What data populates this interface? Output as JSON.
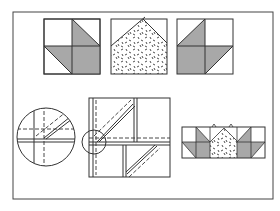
{
  "figure": {
    "title": "",
    "colors": {
      "background": "#ffffff",
      "line": "#333333",
      "shade": "#a8a8a8",
      "print_marks": "#222222"
    },
    "top_row": [
      {
        "name": "leaf-block-left",
        "type": "quartered square with shaded triangles"
      },
      {
        "name": "print-block-center",
        "type": "square with print fabric pointed top"
      },
      {
        "name": "leaf-block-right",
        "type": "mirrored quartered square with shaded triangles"
      }
    ],
    "bottom_row": [
      {
        "name": "magnified-detail-circle",
        "type": "close-up of seam intersection"
      },
      {
        "name": "stitching-diagram",
        "type": "block with dashed stitching lines and callout circle"
      },
      {
        "name": "assembled-row",
        "type": "leaf, print, leaf blocks joined"
      }
    ]
  }
}
